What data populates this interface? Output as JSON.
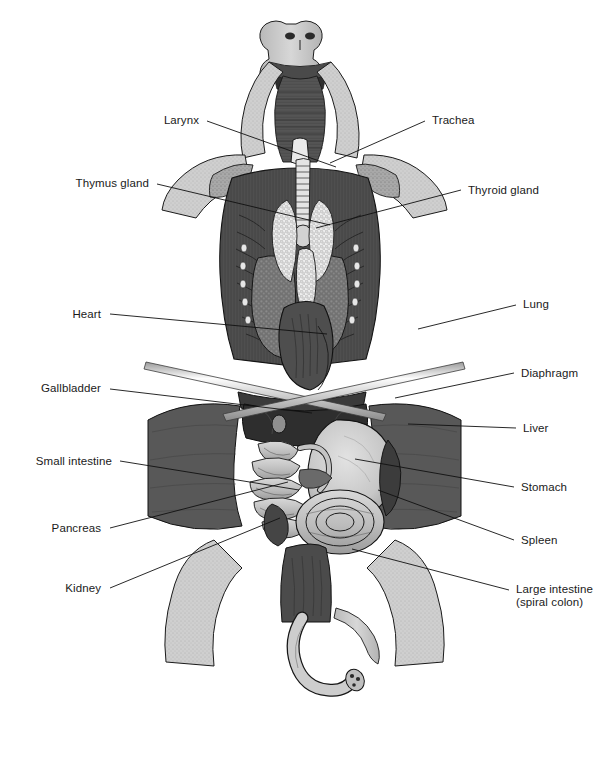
{
  "figure": {
    "view": "ventral",
    "background_color": "#ffffff",
    "line_color": "#111111",
    "label_color": "#1a1a1a",
    "width": 609,
    "height": 781,
    "credit": ""
  },
  "labels_left": [
    {
      "id": "larynx",
      "text": "Larynx",
      "text_x": 199,
      "text_y": 124,
      "line": [
        [
          207,
          121
        ],
        [
          336,
          167
        ]
      ]
    },
    {
      "id": "thymus-gland",
      "text": "Thymus gland",
      "text_x": 149,
      "text_y": 187,
      "line": [
        [
          157,
          184
        ],
        [
          330,
          225
        ]
      ]
    },
    {
      "id": "heart",
      "text": "Heart",
      "text_x": 101,
      "text_y": 318,
      "line": [
        [
          110,
          314
        ],
        [
          327,
          334
        ]
      ]
    },
    {
      "id": "gallbladder",
      "text": "Gallbladder",
      "text_x": 101,
      "text_y": 392,
      "line": [
        [
          110,
          389
        ],
        [
          312,
          413
        ]
      ]
    },
    {
      "id": "small-intestine",
      "text": "Small intestine",
      "text_x": 112,
      "text_y": 465,
      "line": [
        [
          120,
          461
        ],
        [
          299,
          490
        ]
      ]
    },
    {
      "id": "pancreas",
      "text": "Pancreas",
      "text_x": 101,
      "text_y": 532,
      "line": [
        [
          110,
          528
        ],
        [
          288,
          482
        ]
      ]
    },
    {
      "id": "kidney",
      "text": "Kidney",
      "text_x": 101,
      "text_y": 592,
      "line": [
        [
          110,
          588
        ],
        [
          280,
          518
        ]
      ]
    }
  ],
  "labels_right": [
    {
      "id": "trachea",
      "text": "Trachea",
      "text_x": 432,
      "text_y": 124,
      "line": [
        [
          425,
          121
        ],
        [
          330,
          163
        ]
      ]
    },
    {
      "id": "thyroid-gland",
      "text": "Thyroid gland",
      "text_x": 468,
      "text_y": 194,
      "line": [
        [
          461,
          190
        ],
        [
          316,
          228
        ]
      ]
    },
    {
      "id": "lung",
      "text": "Lung",
      "text_x": 523,
      "text_y": 308,
      "line": [
        [
          516,
          305
        ],
        [
          418,
          329
        ]
      ]
    },
    {
      "id": "diaphragm",
      "text": "Diaphragm",
      "text_x": 521,
      "text_y": 377,
      "line": [
        [
          514,
          373
        ],
        [
          395,
          398
        ]
      ]
    },
    {
      "id": "liver",
      "text": "Liver",
      "text_x": 523,
      "text_y": 432,
      "line": [
        [
          516,
          428
        ],
        [
          408,
          424
        ]
      ]
    },
    {
      "id": "stomach",
      "text": "Stomach",
      "text_x": 521,
      "text_y": 491,
      "line": [
        [
          514,
          487
        ],
        [
          355,
          459
        ]
      ]
    },
    {
      "id": "spleen",
      "text": "Spleen",
      "text_x": 521,
      "text_y": 544,
      "line": [
        [
          514,
          540
        ],
        [
          378,
          490
        ]
      ]
    },
    {
      "id": "large-intestine",
      "text": "Large intestine\n(spiral colon)",
      "text_x": 516,
      "text_y": 593,
      "line": [
        [
          509,
          590
        ],
        [
          352,
          549
        ]
      ]
    }
  ],
  "organs": [
    {
      "id": "larynx",
      "name": "Larynx"
    },
    {
      "id": "trachea",
      "name": "Trachea"
    },
    {
      "id": "thymus-gland",
      "name": "Thymus gland"
    },
    {
      "id": "thyroid-gland",
      "name": "Thyroid gland"
    },
    {
      "id": "heart",
      "name": "Heart"
    },
    {
      "id": "lung",
      "name": "Lung"
    },
    {
      "id": "diaphragm",
      "name": "Diaphragm"
    },
    {
      "id": "gallbladder",
      "name": "Gallbladder"
    },
    {
      "id": "liver",
      "name": "Liver"
    },
    {
      "id": "small-intestine",
      "name": "Small intestine"
    },
    {
      "id": "stomach",
      "name": "Stomach"
    },
    {
      "id": "pancreas",
      "name": "Pancreas"
    },
    {
      "id": "spleen",
      "name": "Spleen"
    },
    {
      "id": "kidney",
      "name": "Kidney"
    },
    {
      "id": "large-intestine",
      "name": "Large intestine (spiral colon)"
    }
  ]
}
